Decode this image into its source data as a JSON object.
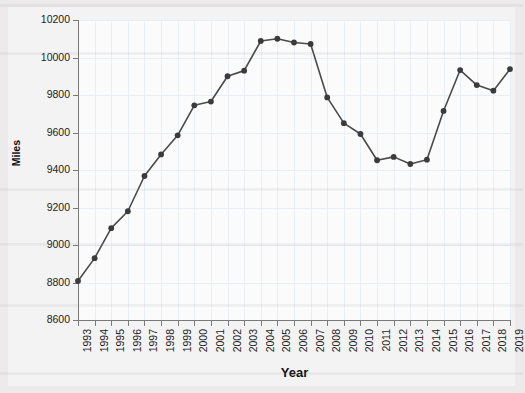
{
  "chart_data": {
    "type": "line",
    "title": "",
    "xlabel": "Year",
    "ylabel": "Miles",
    "categories": [
      "1993",
      "1994",
      "1995",
      "1996",
      "1997",
      "1998",
      "1999",
      "2000",
      "2001",
      "2002",
      "2003",
      "2004",
      "2005",
      "2006",
      "2007",
      "2008",
      "2009",
      "2010",
      "2011",
      "2012",
      "2013",
      "2014",
      "2015",
      "2016",
      "2017",
      "2018",
      "2019"
    ],
    "x": [
      1993,
      1994,
      1995,
      1996,
      1997,
      1998,
      1999,
      2000,
      2001,
      2002,
      2003,
      2004,
      2005,
      2006,
      2007,
      2008,
      2009,
      2010,
      2011,
      2012,
      2013,
      2014,
      2015,
      2016,
      2017,
      2018,
      2019
    ],
    "values": [
      8808,
      8930,
      9090,
      9180,
      9368,
      9483,
      9585,
      9745,
      9765,
      9900,
      9930,
      10088,
      10100,
      10080,
      10072,
      9787,
      9650,
      9592,
      9452,
      9470,
      9432,
      9455,
      9715,
      9933,
      9853,
      9823,
      9938
    ],
    "ylim": [
      8600,
      10200
    ],
    "xlim": [
      1993,
      2019
    ],
    "yticks": [
      8600,
      8800,
      9000,
      9200,
      9400,
      9600,
      9800,
      10000,
      10200
    ],
    "ytick_labels": [
      "8600",
      "8800",
      "9000",
      "9200",
      "9400",
      "9600",
      "9800",
      "10000",
      "10200"
    ],
    "grid": true,
    "legend": false,
    "marker": "circle",
    "line_color": "#4a4a4a",
    "marker_color": "#3b3b3b",
    "grid_color": "#e9eef4",
    "axis_color": "#7a7a7a",
    "plot_background": "#fbfbfb",
    "figure_background": "#eceaea"
  }
}
